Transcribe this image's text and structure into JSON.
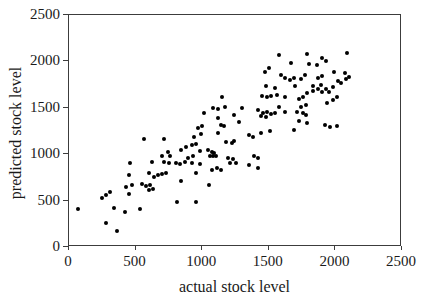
{
  "colors": {
    "background": "#ffffff",
    "axis": "#3c3c3c",
    "text": "#1a1a1a",
    "marker": "#000000"
  },
  "chart_data": {
    "type": "scatter",
    "title": "",
    "xlabel": "actual stock level",
    "ylabel": "predicted stock level",
    "xlim": [
      0,
      2500
    ],
    "ylim": [
      0,
      2500
    ],
    "xticks": [
      0,
      500,
      1000,
      1500,
      2000,
      2500
    ],
    "yticks": [
      0,
      500,
      1000,
      1500,
      2000,
      2500
    ],
    "grid": false,
    "legend": "none",
    "marker": {
      "shape": "circle",
      "color": "#000000",
      "diameter_px": 4
    },
    "points": [
      [
        70,
        410
      ],
      [
        250,
        530
      ],
      [
        280,
        560
      ],
      [
        280,
        260
      ],
      [
        310,
        590
      ],
      [
        340,
        420
      ],
      [
        360,
        170
      ],
      [
        420,
        380
      ],
      [
        430,
        650
      ],
      [
        450,
        780
      ],
      [
        450,
        570
      ],
      [
        460,
        910
      ],
      [
        470,
        670
      ],
      [
        530,
        410
      ],
      [
        550,
        680
      ],
      [
        560,
        1160
      ],
      [
        580,
        660
      ],
      [
        600,
        800
      ],
      [
        600,
        610
      ],
      [
        610,
        670
      ],
      [
        620,
        920
      ],
      [
        630,
        620
      ],
      [
        640,
        750
      ],
      [
        670,
        780
      ],
      [
        700,
        790
      ],
      [
        700,
        980
      ],
      [
        710,
        1160
      ],
      [
        710,
        920
      ],
      [
        730,
        800
      ],
      [
        740,
        1020
      ],
      [
        750,
        910
      ],
      [
        760,
        980
      ],
      [
        800,
        900
      ],
      [
        810,
        490
      ],
      [
        830,
        890
      ],
      [
        840,
        710
      ],
      [
        840,
        1050
      ],
      [
        870,
        920
      ],
      [
        880,
        1080
      ],
      [
        890,
        960
      ],
      [
        920,
        1100
      ],
      [
        920,
        910
      ],
      [
        930,
        980
      ],
      [
        940,
        1190
      ],
      [
        950,
        1110
      ],
      [
        950,
        800
      ],
      [
        950,
        480
      ],
      [
        970,
        1280
      ],
      [
        980,
        1030
      ],
      [
        980,
        890
      ],
      [
        990,
        1220
      ],
      [
        1000,
        1300
      ],
      [
        1010,
        1440
      ],
      [
        1040,
        1040
      ],
      [
        1050,
        670
      ],
      [
        1060,
        980
      ],
      [
        1070,
        1020
      ],
      [
        1070,
        830
      ],
      [
        1080,
        1500
      ],
      [
        1080,
        980
      ],
      [
        1090,
        1010
      ],
      [
        1100,
        980
      ],
      [
        1110,
        850
      ],
      [
        1120,
        1490
      ],
      [
        1120,
        1390
      ],
      [
        1120,
        1230
      ],
      [
        1140,
        1320
      ],
      [
        1140,
        830
      ],
      [
        1150,
        1620
      ],
      [
        1160,
        1300
      ],
      [
        1170,
        1510
      ],
      [
        1180,
        1130
      ],
      [
        1190,
        960
      ],
      [
        1210,
        910
      ],
      [
        1220,
        1120
      ],
      [
        1230,
        950
      ],
      [
        1240,
        1420
      ],
      [
        1240,
        1140
      ],
      [
        1250,
        900
      ],
      [
        1280,
        1350
      ],
      [
        1300,
        1500
      ],
      [
        1350,
        1210
      ],
      [
        1350,
        880
      ],
      [
        1380,
        1190
      ],
      [
        1390,
        980
      ],
      [
        1420,
        1480
      ],
      [
        1420,
        960
      ],
      [
        1420,
        850
      ],
      [
        1440,
        1410
      ],
      [
        1440,
        1230
      ],
      [
        1450,
        1630
      ],
      [
        1460,
        1440
      ],
      [
        1470,
        1890
      ],
      [
        1480,
        1730
      ],
      [
        1480,
        1400
      ],
      [
        1490,
        1620
      ],
      [
        1490,
        1460
      ],
      [
        1500,
        1930
      ],
      [
        1510,
        1250
      ],
      [
        1520,
        1630
      ],
      [
        1520,
        1430
      ],
      [
        1550,
        1710
      ],
      [
        1550,
        1440
      ],
      [
        1560,
        1640
      ],
      [
        1580,
        2070
      ],
      [
        1580,
        1510
      ],
      [
        1590,
        1850
      ],
      [
        1620,
        1820
      ],
      [
        1620,
        1620
      ],
      [
        1620,
        1460
      ],
      [
        1660,
        1800
      ],
      [
        1670,
        1980
      ],
      [
        1690,
        1820
      ],
      [
        1690,
        1260
      ],
      [
        1700,
        1730
      ],
      [
        1710,
        1460
      ],
      [
        1730,
        1590
      ],
      [
        1730,
        1360
      ],
      [
        1740,
        1810
      ],
      [
        1740,
        1510
      ],
      [
        1760,
        1620
      ],
      [
        1760,
        1440
      ],
      [
        1770,
        1850
      ],
      [
        1780,
        1530
      ],
      [
        1780,
        1420
      ],
      [
        1790,
        2080
      ],
      [
        1790,
        1660
      ],
      [
        1790,
        1340
      ],
      [
        1800,
        1970
      ],
      [
        1830,
        1730
      ],
      [
        1830,
        1680
      ],
      [
        1860,
        1960
      ],
      [
        1870,
        1820
      ],
      [
        1870,
        1700
      ],
      [
        1890,
        1750
      ],
      [
        1900,
        2040
      ],
      [
        1900,
        1840
      ],
      [
        1900,
        1670
      ],
      [
        1920,
        1310
      ],
      [
        1930,
        2000
      ],
      [
        1930,
        1700
      ],
      [
        1940,
        1550
      ],
      [
        1950,
        1670
      ],
      [
        1960,
        1290
      ],
      [
        1980,
        1720
      ],
      [
        1980,
        1580
      ],
      [
        1990,
        1890
      ],
      [
        2010,
        1620
      ],
      [
        2010,
        1300
      ],
      [
        2020,
        1790
      ],
      [
        2040,
        1770
      ],
      [
        2070,
        1880
      ],
      [
        2080,
        1810
      ],
      [
        2090,
        2090
      ],
      [
        2100,
        1830
      ]
    ]
  }
}
